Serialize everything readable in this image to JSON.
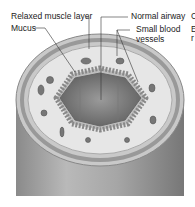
{
  "diagram": {
    "labels": {
      "relaxed_muscle": "Relaxed muscle layer",
      "mucus": "Mucus",
      "normal_airway": "Normal airway",
      "small_blood_1": "Small blood",
      "small_blood_2": "vessels"
    },
    "cut_off_text": {
      "line1": "C",
      "line2a": "E",
      "line2b": "r"
    }
  }
}
